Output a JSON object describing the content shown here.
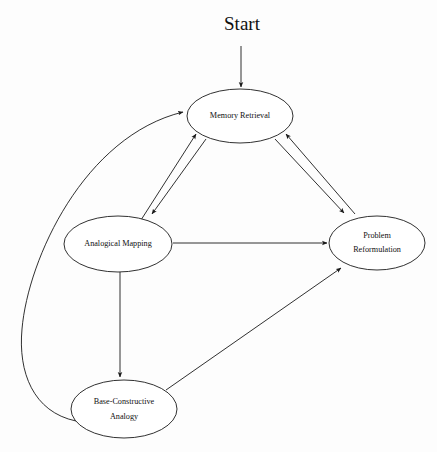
{
  "diagram": {
    "title": "Start",
    "entry_label": "Start",
    "stroke_color": "#1a1a1a",
    "background_color": "#ffffff",
    "nodes": [
      {
        "id": "memory-retrieval",
        "label": "Memory Retrieval",
        "line1": "Memory Retrieval",
        "line2": "",
        "cx": 240,
        "cy": 116,
        "rx": 53,
        "ry": 27
      },
      {
        "id": "analogical-mapping",
        "label": "Analogical Mapping",
        "line1": "Analogical Mapping",
        "line2": "",
        "cx": 118,
        "cy": 244,
        "rx": 54,
        "ry": 28
      },
      {
        "id": "problem-reformulation",
        "label": "Problem Reformulation",
        "line1": "Problem",
        "line2": "Reformulation",
        "cx": 377,
        "cy": 243,
        "rx": 48,
        "ry": 27
      },
      {
        "id": "base-constructive-analogy",
        "label": "Base-Constructive Analogy",
        "line1": "Base-Constructive",
        "line2": "Analogy",
        "cx": 124,
        "cy": 409,
        "rx": 53,
        "ry": 29
      }
    ],
    "edges": [
      {
        "id": "start-to-memory",
        "from": "start",
        "to": "memory-retrieval",
        "kind": "straight",
        "directed": true
      },
      {
        "id": "memory-to-mapping",
        "from": "memory-retrieval",
        "to": "analogical-mapping",
        "kind": "straight",
        "directed": true
      },
      {
        "id": "mapping-to-memory",
        "from": "analogical-mapping",
        "to": "memory-retrieval",
        "kind": "straight",
        "directed": true
      },
      {
        "id": "memory-to-reformulation",
        "from": "memory-retrieval",
        "to": "problem-reformulation",
        "kind": "straight",
        "directed": true
      },
      {
        "id": "reformulation-to-memory",
        "from": "problem-reformulation",
        "to": "memory-retrieval",
        "kind": "straight",
        "directed": true
      },
      {
        "id": "mapping-to-reformulation",
        "from": "analogical-mapping",
        "to": "problem-reformulation",
        "kind": "straight",
        "directed": true
      },
      {
        "id": "mapping-to-base",
        "from": "analogical-mapping",
        "to": "base-constructive-analogy",
        "kind": "straight",
        "directed": true
      },
      {
        "id": "base-to-reformulation",
        "from": "base-constructive-analogy",
        "to": "problem-reformulation",
        "kind": "straight",
        "directed": true
      },
      {
        "id": "base-to-memory",
        "from": "base-constructive-analogy",
        "to": "memory-retrieval",
        "kind": "curved",
        "directed": true
      }
    ]
  }
}
